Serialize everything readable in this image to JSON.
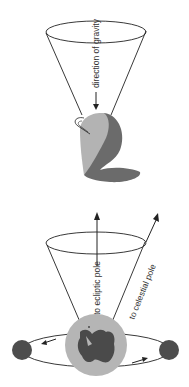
{
  "figure": {
    "top_panel": {
      "name": "spinning-top-precession",
      "label_gravity": "direction of gravity"
    },
    "bottom_panel": {
      "name": "earth-precession",
      "label_ecliptic": "to ecliptic pole",
      "label_celestial": "to celestial pole"
    }
  },
  "colors": {
    "line": "#222222",
    "top_light": "#b3b3b3",
    "top_dark": "#6b6b6b",
    "earth_ocean": "#b5b5b5",
    "earth_land": "#4a4a4a",
    "moon_body": "#4d4d4d"
  }
}
